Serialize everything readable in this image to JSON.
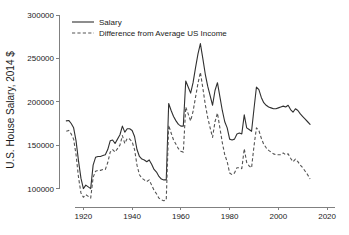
{
  "chart_data": {
    "type": "line",
    "title": "",
    "xlabel": "",
    "ylabel": "U.S. House Salary, 2014 $",
    "xlim": [
      1910,
      2022
    ],
    "ylim": [
      88000,
      300000
    ],
    "xticks": [
      1920,
      1940,
      1960,
      1980,
      2000,
      2020
    ],
    "xtick_labels": [
      "1920",
      "1940",
      "1960",
      "1980",
      "2000",
      "2020"
    ],
    "yticks": [
      100000,
      150000,
      200000,
      250000,
      300000
    ],
    "ytick_labels": [
      "100000",
      "150000",
      "200000",
      "250000",
      "300000"
    ],
    "grid": false,
    "legend_position": "top-left",
    "legend": [
      "Salary",
      "Difference from Average US Income"
    ],
    "x": [
      1913,
      1914,
      1915,
      1916,
      1917,
      1918,
      1919,
      1920,
      1921,
      1922,
      1923,
      1924,
      1925,
      1926,
      1927,
      1928,
      1929,
      1930,
      1931,
      1932,
      1933,
      1934,
      1935,
      1936,
      1937,
      1938,
      1939,
      1940,
      1941,
      1942,
      1943,
      1944,
      1945,
      1946,
      1947,
      1948,
      1949,
      1950,
      1951,
      1952,
      1953,
      1954,
      1955,
      1956,
      1957,
      1958,
      1959,
      1960,
      1961,
      1962,
      1963,
      1964,
      1965,
      1966,
      1967,
      1968,
      1969,
      1970,
      1971,
      1972,
      1973,
      1974,
      1975,
      1976,
      1977,
      1978,
      1979,
      1980,
      1981,
      1982,
      1983,
      1984,
      1985,
      1986,
      1987,
      1988,
      1989,
      1990,
      1991,
      1992,
      1993,
      1994,
      1995,
      1996,
      1997,
      1998,
      1999,
      2000,
      2001,
      2002,
      2003,
      2004,
      2005,
      2006,
      2007,
      2008,
      2009,
      2010,
      2011,
      2012,
      2013
    ],
    "series": [
      {
        "name": "Salary",
        "style": "solid",
        "color": "#303030",
        "values": [
          178000,
          178500,
          175000,
          170000,
          155000,
          132000,
          112000,
          100000,
          104000,
          102000,
          100000,
          127000,
          136000,
          137000,
          137000,
          138000,
          139000,
          145000,
          155000,
          156000,
          152000,
          157000,
          162000,
          172000,
          165000,
          169000,
          169000,
          167000,
          160000,
          145000,
          137000,
          134000,
          133000,
          131000,
          133000,
          128000,
          122000,
          119000,
          114000,
          111000,
          110000,
          110000,
          198000,
          190000,
          183000,
          178000,
          174000,
          172000,
          172000,
          224000,
          217000,
          210000,
          222000,
          239000,
          255000,
          267000,
          250000,
          232000,
          218000,
          207000,
          196000,
          213000,
          222000,
          206000,
          190000,
          177000,
          170000,
          157000,
          156000,
          157000,
          163000,
          164000,
          163000,
          185000,
          170000,
          168000,
          166000,
          192000,
          217000,
          214000,
          205000,
          199000,
          196000,
          194000,
          193000,
          192000,
          192000,
          193000,
          194000,
          195000,
          194000,
          196000,
          191000,
          188000,
          192000,
          190000,
          186000,
          183000,
          180000,
          177000,
          174000
        ]
      },
      {
        "name": "Difference from Average US Income",
        "style": "dashed",
        "color": "#545454",
        "values": [
          166000,
          167000,
          163000,
          157000,
          139000,
          113000,
          95000,
          90000,
          93000,
          91000,
          89000,
          113000,
          120000,
          121000,
          121000,
          122000,
          122000,
          130000,
          142000,
          145000,
          142000,
          146000,
          150000,
          161000,
          152000,
          158000,
          157000,
          154000,
          145000,
          127000,
          116000,
          112000,
          110000,
          108000,
          110000,
          104000,
          98000,
          94000,
          89000,
          87000,
          86000,
          87000,
          173000,
          164000,
          156000,
          151000,
          146000,
          143000,
          142000,
          194000,
          186000,
          178000,
          189000,
          205000,
          221000,
          234000,
          216000,
          197000,
          182000,
          170000,
          159000,
          177000,
          187000,
          170000,
          153000,
          139000,
          131000,
          118000,
          116000,
          118000,
          124000,
          124000,
          123000,
          146000,
          130000,
          126000,
          124000,
          149000,
          170000,
          167000,
          158000,
          151000,
          147000,
          144000,
          142000,
          140000,
          139000,
          139000,
          139000,
          141000,
          139000,
          140000,
          135000,
          131000,
          134000,
          131000,
          127000,
          124000,
          120000,
          116000,
          111000
        ]
      }
    ]
  }
}
